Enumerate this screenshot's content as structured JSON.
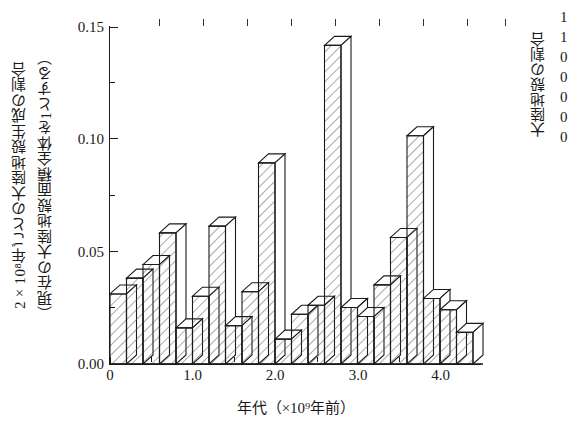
{
  "figure": {
    "axes": {
      "y_title_line1": "2×10⁸年ごとの大陸地殻生成の割合",
      "y_title_line2": "（現在の大陸地殻面積全体を1とする）",
      "x_title": "年代（×10⁹年前）",
      "right_title": "大陸地殻の割合",
      "y_ticks": [
        "0.15",
        "0.10",
        "0.05",
        "0.00"
      ],
      "x_ticks": [
        "0",
        "1.0",
        "2.0",
        "3.0",
        "4.0"
      ],
      "right_clipped_numbers": [
        "1",
        "1",
        "0",
        "0",
        "0",
        "0",
        "0"
      ]
    },
    "style": {
      "line_color": "#1a1a1a",
      "hatch_color": "#555555",
      "background": "#ffffff"
    }
  },
  "chart_data": {
    "type": "bar",
    "title": "",
    "xlabel": "年代（×10⁹年前）",
    "ylabel": "2×10⁸年ごとの大陸地殻生成の割合（現在の大陸地殻面積全体を1とする）",
    "xlim": [
      0,
      4.5
    ],
    "ylim": [
      0,
      0.155
    ],
    "y_ticks": [
      0.0,
      0.05,
      0.1,
      0.15
    ],
    "y_minor_ticks": [
      0.025,
      0.075,
      0.125
    ],
    "x_ticks": [
      0,
      1.0,
      2.0,
      3.0,
      4.0
    ],
    "x_minor_ticks": [
      0.5,
      1.5,
      2.5,
      3.5
    ],
    "grid": false,
    "legend": false,
    "bin_width": 0.2,
    "bin_starts": [
      0.0,
      0.2,
      0.4,
      0.6,
      0.8,
      1.0,
      1.2,
      1.4,
      1.6,
      1.8,
      2.0,
      2.2,
      2.4,
      2.6,
      2.8,
      3.0,
      3.2,
      3.4,
      3.6,
      3.8,
      4.0,
      4.2
    ],
    "categories": [
      "0.0-0.2",
      "0.2-0.4",
      "0.4-0.6",
      "0.6-0.8",
      "0.8-1.0",
      "1.0-1.2",
      "1.2-1.4",
      "1.4-1.6",
      "1.6-1.8",
      "1.8-2.0",
      "2.0-2.2",
      "2.2-2.4",
      "2.4-2.6",
      "2.6-2.8",
      "2.8-3.0",
      "3.0-3.2",
      "3.2-3.4",
      "3.4-3.6",
      "3.6-3.8",
      "3.8-4.0",
      "4.0-4.2",
      "4.2-4.4"
    ],
    "values": [
      0.031,
      0.038,
      0.044,
      0.058,
      0.016,
      0.03,
      0.061,
      0.017,
      0.032,
      0.089,
      0.011,
      0.022,
      0.026,
      0.141,
      0.025,
      0.021,
      0.035,
      0.056,
      0.101,
      0.029,
      0.024,
      0.014
    ]
  }
}
